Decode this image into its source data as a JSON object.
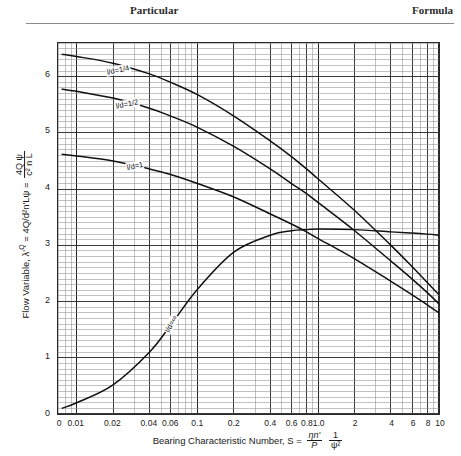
{
  "header": {
    "particular": "Particular",
    "formula": "Formula"
  },
  "axes": {
    "x_title_prefix": "Bearing Characteristic Number, S =",
    "x_frac1_num": "ηn'",
    "x_frac1_den": "P",
    "x_frac2_num": "1",
    "x_frac2_den": "ψ²",
    "y_title_prefix": "Flow Variable, λ'",
    "y_title_sub": "Q",
    "y_title_mid": " = 4Q/d²n'Lψ =",
    "y_frac_num": "4Q ψ",
    "y_frac_den": "c² n L",
    "x_ticks": [
      "0",
      "0.01",
      "0.02",
      "0.04",
      "0.06",
      "0.1",
      "0.2",
      "0.4",
      "0.6",
      "0.8",
      "1.0",
      "2",
      "4",
      "6",
      "8",
      "10"
    ],
    "y_ticks": [
      "0",
      "1",
      "2",
      "3",
      "4",
      "5",
      "6"
    ],
    "x_origin_label": "0"
  },
  "chart_data": {
    "type": "line",
    "title": "",
    "xlabel": "Bearing Characteristic Number, S",
    "ylabel": "Flow Variable, lambda'Q = 4Q/(d^2 n' L psi)",
    "x_scale": "log",
    "y_scale": "linear",
    "xlim": [
      0.007,
      10
    ],
    "ylim": [
      0,
      6.6
    ],
    "grid": true,
    "legend": "inline-curve-labels",
    "x_tick_values": [
      0.01,
      0.02,
      0.04,
      0.06,
      0.1,
      0.2,
      0.4,
      0.6,
      0.8,
      1.0,
      2,
      4,
      6,
      8,
      10
    ],
    "y_tick_values": [
      0,
      1,
      2,
      3,
      4,
      5,
      6
    ],
    "series": [
      {
        "name": "l/d=1/4",
        "label": "l/d=1/4",
        "label_x": 0.022,
        "label_y": 6.12,
        "points": [
          [
            0.0075,
            6.4
          ],
          [
            0.01,
            6.36
          ],
          [
            0.02,
            6.24
          ],
          [
            0.04,
            6.05
          ],
          [
            0.06,
            5.9
          ],
          [
            0.1,
            5.68
          ],
          [
            0.2,
            5.3
          ],
          [
            0.4,
            4.86
          ],
          [
            0.6,
            4.58
          ],
          [
            0.8,
            4.36
          ],
          [
            1.0,
            4.18
          ],
          [
            2.0,
            3.62
          ],
          [
            4.0,
            3.0
          ],
          [
            6.0,
            2.62
          ],
          [
            8.0,
            2.34
          ],
          [
            10.0,
            2.12
          ]
        ]
      },
      {
        "name": "l/d=1/2",
        "label": "l/d=1/2",
        "label_x": 0.026,
        "label_y": 5.52,
        "points": [
          [
            0.0075,
            5.78
          ],
          [
            0.01,
            5.74
          ],
          [
            0.02,
            5.62
          ],
          [
            0.04,
            5.44
          ],
          [
            0.06,
            5.3
          ],
          [
            0.1,
            5.1
          ],
          [
            0.2,
            4.76
          ],
          [
            0.4,
            4.36
          ],
          [
            0.6,
            4.1
          ],
          [
            0.8,
            3.92
          ],
          [
            1.0,
            3.76
          ],
          [
            2.0,
            3.26
          ],
          [
            4.0,
            2.72
          ],
          [
            6.0,
            2.4
          ],
          [
            8.0,
            2.16
          ],
          [
            10.0,
            1.96
          ]
        ]
      },
      {
        "name": "l/d=1",
        "label": "l/d=1",
        "label_x": 0.03,
        "label_y": 4.42,
        "points": [
          [
            0.0075,
            4.62
          ],
          [
            0.01,
            4.59
          ],
          [
            0.02,
            4.5
          ],
          [
            0.04,
            4.36
          ],
          [
            0.06,
            4.26
          ],
          [
            0.1,
            4.1
          ],
          [
            0.2,
            3.86
          ],
          [
            0.4,
            3.56
          ],
          [
            0.6,
            3.38
          ],
          [
            0.8,
            3.24
          ],
          [
            1.0,
            3.12
          ],
          [
            2.0,
            2.76
          ],
          [
            4.0,
            2.36
          ],
          [
            6.0,
            2.12
          ],
          [
            8.0,
            1.94
          ],
          [
            10.0,
            1.8
          ]
        ]
      },
      {
        "name": "l/d=infinity",
        "label": "l/d=∞",
        "label_x": 0.06,
        "label_y": 1.62,
        "points": [
          [
            0.0075,
            0.1
          ],
          [
            0.01,
            0.2
          ],
          [
            0.02,
            0.52
          ],
          [
            0.04,
            1.1
          ],
          [
            0.06,
            1.58
          ],
          [
            0.1,
            2.22
          ],
          [
            0.2,
            2.88
          ],
          [
            0.4,
            3.18
          ],
          [
            0.6,
            3.26
          ],
          [
            0.8,
            3.28
          ],
          [
            1.0,
            3.29
          ],
          [
            2.0,
            3.28
          ],
          [
            4.0,
            3.24
          ],
          [
            6.0,
            3.22
          ],
          [
            8.0,
            3.2
          ],
          [
            10.0,
            3.18
          ]
        ]
      }
    ]
  }
}
